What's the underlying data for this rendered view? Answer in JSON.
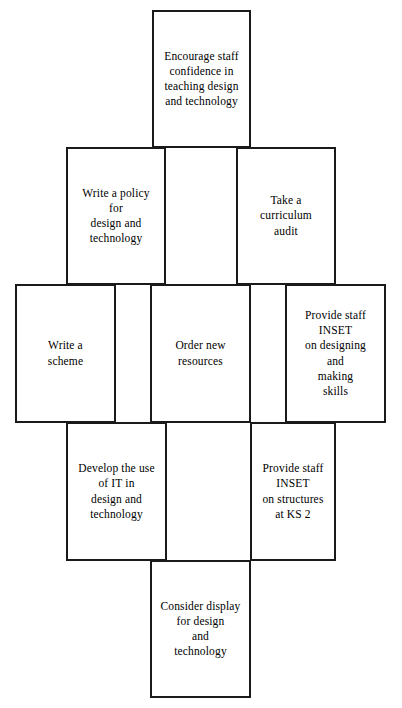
{
  "diagram": {
    "type": "flow-boxes-grid",
    "border_color": "#1a1a1a",
    "background_color": "#ffffff",
    "text_color": "#000000",
    "rows": [
      {
        "row_index": 1,
        "nodes": [
          {
            "id": "encourage-staff-confidence",
            "text": "Encourage staff\nconfidence in\nteaching design\nand technology"
          }
        ]
      },
      {
        "row_index": 2,
        "nodes": [
          {
            "id": "write-a-policy",
            "text": "Write a policy\nfor\ndesign and\ntechnology"
          },
          {
            "id": "curriculum-audit",
            "text": "Take a\ncurriculum\naudit"
          }
        ]
      },
      {
        "row_index": 3,
        "nodes": [
          {
            "id": "write-a-scheme",
            "text": "Write a\nscheme"
          },
          {
            "id": "order-new-resources",
            "text": "Order new\nresources"
          },
          {
            "id": "inset-designing-making",
            "text": "Provide staff\nINSET\non designing\nand\nmaking\nskills"
          }
        ]
      },
      {
        "row_index": 4,
        "nodes": [
          {
            "id": "develop-use-of-it",
            "text": "Develop the use\nof IT in\ndesign and\ntechnology"
          },
          {
            "id": "inset-structures-ks2",
            "text": "Provide staff\nINSET\non structures\nat KS 2"
          }
        ]
      },
      {
        "row_index": 5,
        "nodes": [
          {
            "id": "consider-display",
            "text": "Consider display\nfor design\nand\ntechnology"
          }
        ]
      }
    ]
  }
}
